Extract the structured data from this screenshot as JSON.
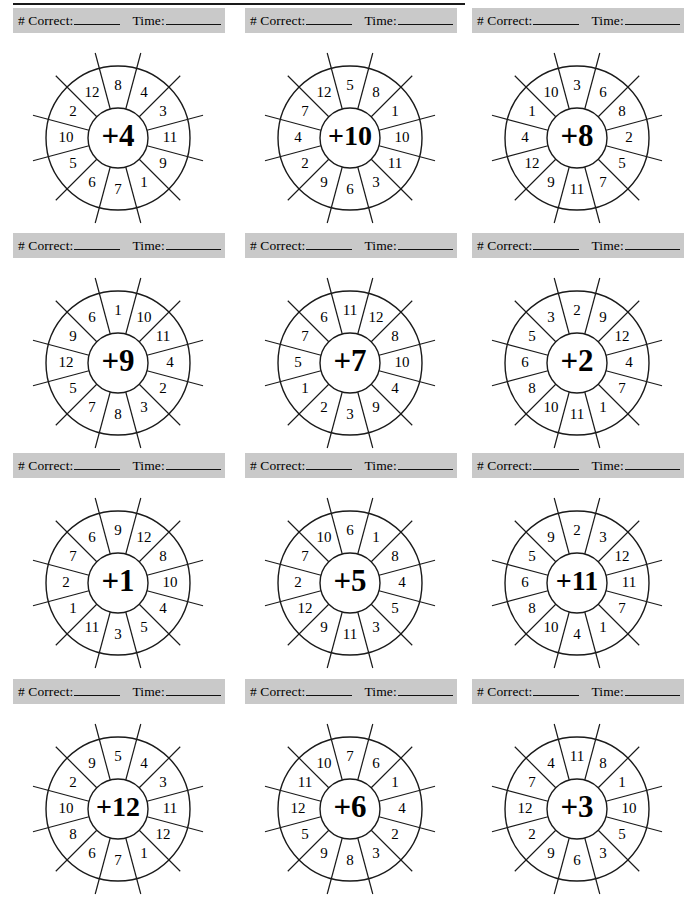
{
  "page": {
    "columns": 3,
    "rows": 4
  },
  "score_bar": {
    "correct_label": "# Correct:",
    "time_label": "Time:",
    "correct_value": "",
    "time_value": ""
  },
  "wheel_geometry": {
    "segments": 12,
    "outer_radius": 72,
    "inner_radius": 30,
    "number_ring_radius": 52,
    "spoke_overhang": 16,
    "start_angle_deg": -75
  },
  "chart_data": {
    "type": "table",
    "columns": [
      "center",
      "ring_numbers_clockwise_from_top"
    ],
    "wheels": [
      {
        "id": 1,
        "center": "+4",
        "numbers": [
          4,
          3,
          11,
          9,
          1,
          7,
          6,
          5,
          10,
          2,
          12,
          8
        ]
      },
      {
        "id": 2,
        "center": "+10",
        "numbers": [
          8,
          1,
          10,
          11,
          3,
          6,
          9,
          2,
          4,
          7,
          12,
          5
        ]
      },
      {
        "id": 3,
        "center": "+8",
        "numbers": [
          6,
          8,
          2,
          5,
          7,
          11,
          9,
          12,
          4,
          1,
          10,
          3
        ]
      },
      {
        "id": 4,
        "center": "+9",
        "numbers": [
          10,
          11,
          4,
          2,
          3,
          8,
          7,
          5,
          12,
          9,
          6,
          1
        ]
      },
      {
        "id": 5,
        "center": "+7",
        "numbers": [
          12,
          8,
          10,
          4,
          9,
          3,
          2,
          1,
          5,
          7,
          6,
          11
        ]
      },
      {
        "id": 6,
        "center": "+2",
        "numbers": [
          9,
          12,
          4,
          7,
          1,
          11,
          10,
          8,
          6,
          5,
          3,
          2
        ]
      },
      {
        "id": 7,
        "center": "+1",
        "numbers": [
          12,
          8,
          10,
          4,
          5,
          3,
          11,
          1,
          2,
          7,
          6,
          9
        ]
      },
      {
        "id": 8,
        "center": "+5",
        "numbers": [
          1,
          8,
          4,
          5,
          3,
          11,
          9,
          12,
          2,
          7,
          10,
          6
        ]
      },
      {
        "id": 9,
        "center": "+11",
        "numbers": [
          3,
          12,
          11,
          7,
          1,
          4,
          10,
          8,
          6,
          5,
          9,
          2
        ]
      },
      {
        "id": 10,
        "center": "+12",
        "numbers": [
          4,
          3,
          11,
          12,
          1,
          7,
          6,
          8,
          10,
          2,
          9,
          5
        ]
      },
      {
        "id": 11,
        "center": "+6",
        "numbers": [
          6,
          1,
          4,
          2,
          3,
          8,
          9,
          5,
          12,
          11,
          10,
          7
        ]
      },
      {
        "id": 12,
        "center": "+3",
        "numbers": [
          8,
          1,
          10,
          5,
          3,
          6,
          9,
          2,
          12,
          7,
          4,
          11
        ]
      }
    ]
  },
  "colors": {
    "score_bar_background": "#c9c9c9",
    "ink": "#1a1a1a",
    "paper": "#ffffff"
  }
}
